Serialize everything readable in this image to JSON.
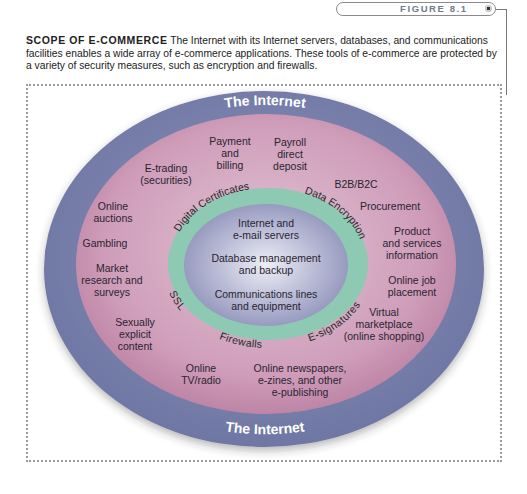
{
  "figure": {
    "label": "FIGURE 8.1"
  },
  "caption": {
    "title": "SCOPE OF E-COMMERCE",
    "text": " The Internet with its Internet servers, databases, and communications facilities enables a wide array of e-commerce applications. These tools of e-commerce are protected by a variety of security measures, such as encryption and firewalls."
  },
  "diagram": {
    "colors": {
      "outer_ring": "#7a82ab",
      "middle_ring": "#c48aa8",
      "security_ring": "#8ec9b4",
      "core": "#a7a9c8"
    },
    "outer_ring": {
      "top_label": "The Internet",
      "bottom_label": "The Internet"
    },
    "applications": [
      "E-trading\n(securities)",
      "Payment\nand\nbilling",
      "Payroll\ndirect\ndeposit",
      "B2B/B2C",
      "Online\nauctions",
      "Procurement",
      "Gambling",
      "Product\nand services\ninformation",
      "Market\nresearch and\nsurveys",
      "Online job\nplacement",
      "Virtual\nmarketplace\n(online shopping)",
      "Sexually\nexplicit\ncontent",
      "Online\nTV/radio",
      "Online newspapers,\ne-zines, and other\ne-publishing"
    ],
    "security": {
      "digital_certificates": "Digital Certificates",
      "data_encryption": "Data Encryption",
      "ssl": "SSL",
      "firewalls": "Firewalls",
      "e_signatures": "E-signatures"
    },
    "core": [
      "Internet and\ne-mail servers",
      "Database management\nand backup",
      "Communications lines\nand equipment"
    ]
  }
}
